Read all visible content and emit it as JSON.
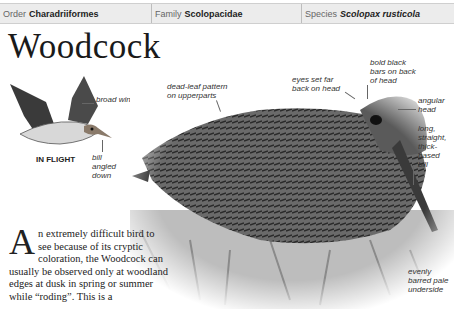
{
  "header": {
    "order_label": "Order",
    "order_value": "Charadriiformes",
    "family_label": "Family",
    "family_value": "Scolopacidae",
    "species_label": "Species",
    "species_value": "Scolopax rusticola"
  },
  "title": "Woodcock",
  "flight_illustration": {
    "caption": "IN FLIGHT",
    "annotations": {
      "wings": "broad wings",
      "bill": "bill angled down"
    }
  },
  "photo_annotations": {
    "upperparts": "dead-leaf pattern on upperparts",
    "eyes": "eyes set far back on head",
    "head_bars": "bold black bars on back of head",
    "head_shape": "angular head",
    "bill": "long, straight, thick-based bill",
    "underside": "evenly barred pale underside"
  },
  "body": {
    "dropcap": "A",
    "text": "n extremely difficult bird to see because of its cryptic coloration, the Woodcock can usually be observed only at woodland edges at dusk in spring or summer while “roding”. This is a"
  }
}
